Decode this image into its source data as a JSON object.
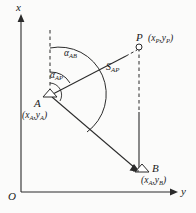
{
  "figure": {
    "background_color": "#fbfbfa",
    "ink_color": "#2b2b2b",
    "axes": {
      "x_label": "x",
      "y_label": "y",
      "origin_label": "O"
    },
    "points": [
      {
        "id": "A",
        "label": "A",
        "coord_label": "(x",
        "coord_sub1": "A",
        "coord_mid": ",y",
        "coord_sub2": "A",
        "coord_end": ")",
        "marker": "triangle"
      },
      {
        "id": "P",
        "label": "P",
        "coord_label": "(x",
        "coord_sub1": "P",
        "coord_mid": ",y",
        "coord_sub2": "P",
        "coord_end": ")",
        "marker": "circle"
      },
      {
        "id": "B",
        "label": "B",
        "coord_label": "(x",
        "coord_sub1": "A",
        "coord_mid": ",y",
        "coord_sub2": "B",
        "coord_end": ")",
        "marker": "triangle"
      }
    ],
    "angles": [
      {
        "id": "alpha_AB",
        "symbol": "α",
        "subscript": "AB"
      },
      {
        "id": "alpha_AP",
        "symbol": "α",
        "subscript": "AP"
      }
    ],
    "segments": [
      {
        "id": "S_AP",
        "symbol": "S",
        "subscript": "AP"
      }
    ]
  }
}
